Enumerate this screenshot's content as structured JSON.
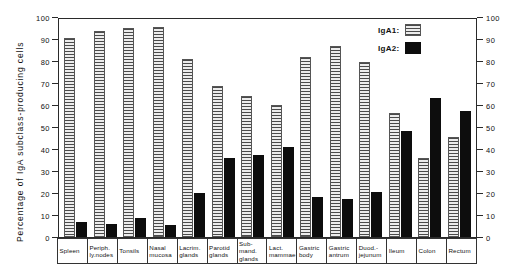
{
  "chart_data": {
    "type": "bar",
    "title": "",
    "xlabel": "",
    "ylabel": "Percentage of IgA subclass-producing cells",
    "ylim": [
      0,
      100
    ],
    "yticks": [
      0,
      10,
      20,
      30,
      40,
      50,
      60,
      70,
      80,
      90,
      100
    ],
    "ytick_labels": [
      "0",
      "10",
      "20",
      "30",
      "40",
      "50",
      "60",
      "70",
      "80",
      "90",
      "100"
    ],
    "right_axis": {
      "ylim": [
        0,
        100
      ],
      "yticks": [
        0,
        10,
        20,
        30,
        40,
        50,
        60,
        70,
        80,
        90,
        100
      ],
      "ytick_labels": [
        "0",
        "10",
        "20",
        "30",
        "40",
        "50",
        "60",
        "70",
        "80",
        "90",
        "100"
      ]
    },
    "grid": false,
    "legend_position": "top-right",
    "categories": [
      "Spleen",
      "Periph. ly.nodes",
      "Tonsils",
      "Nasal mucosa",
      "Lacrim. glands",
      "Parotid glands",
      "Sub-mand. glands",
      "Lact. mammae",
      "Gastric body",
      "Gastric antrum",
      "Duod.-jejunum",
      "Ileum",
      "Colon",
      "Rectum"
    ],
    "category_lines": [
      [
        "Spleen"
      ],
      [
        "Periph.",
        "ly.nodes"
      ],
      [
        "Tonsils"
      ],
      [
        "Nasal",
        "mucosa"
      ],
      [
        "Lacrim.",
        "glands"
      ],
      [
        "Parotid",
        "glands"
      ],
      [
        "Sub-",
        "mand.",
        "glands"
      ],
      [
        "Lact.",
        "mammae"
      ],
      [
        "Gastric",
        "body"
      ],
      [
        "Gastric",
        "antrum"
      ],
      [
        "Duod.-",
        "jejunum"
      ],
      [
        "Ileum"
      ],
      [
        "Colon"
      ],
      [
        "Rectum"
      ]
    ],
    "series": [
      {
        "name": "IgA1",
        "label": "IgA1:",
        "color": "#d8d8d8",
        "pattern": "horizontal-hatch",
        "values": [
          90.5,
          93.5,
          95,
          95.5,
          81,
          68.5,
          64,
          60,
          82,
          87,
          79.5,
          56.5,
          36,
          45.5
        ]
      },
      {
        "name": "IgA2",
        "label": "IgA2:",
        "color": "#0d0d0d",
        "pattern": "solid",
        "values": [
          7,
          6,
          8.5,
          5.5,
          20,
          36,
          37.5,
          41,
          18,
          17.5,
          20.5,
          48,
          63,
          57.5
        ]
      }
    ]
  },
  "legend": {
    "entries": [
      {
        "label": "IgA1:",
        "swatch": "hatched-swatch"
      },
      {
        "label": "IgA2:",
        "swatch": "solid-black-swatch"
      }
    ]
  }
}
